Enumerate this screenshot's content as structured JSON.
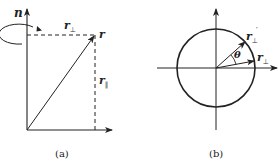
{
  "figure": {
    "panel_a": {
      "caption": "(a)",
      "axis_label": "n",
      "point_label": "r",
      "perp_label_main": "r",
      "perp_label_sub": "⊥",
      "par_label_main": "r",
      "par_label_sub": "∥",
      "rotation_symbol": "rotation-arrow"
    },
    "panel_b": {
      "caption": "(b)",
      "vec_label_main": "r",
      "vec_label_sub": "⊥",
      "rotated_label_main": "r",
      "rotated_label_sub": "⊥",
      "rotated_label_prime": "′",
      "angle_label": "θ"
    },
    "colors": {
      "ink": "#222222",
      "background": "#ffffff"
    }
  }
}
